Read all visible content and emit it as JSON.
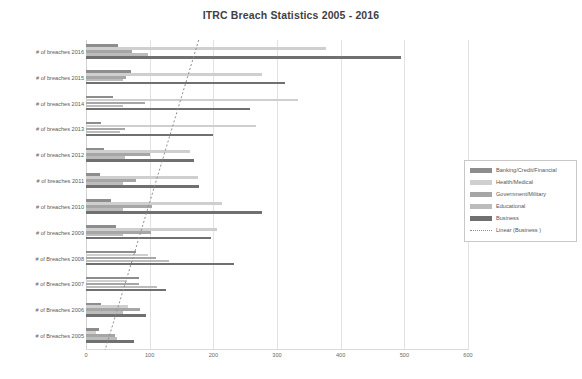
{
  "chart_data": {
    "type": "bar",
    "orientation": "horizontal",
    "title": "ITRC Breach Statistics 2005 - 2016",
    "xlabel": "",
    "ylabel": "",
    "xlim": [
      0,
      600
    ],
    "xticks": [
      0,
      100,
      200,
      300,
      400,
      500,
      600
    ],
    "grid": true,
    "legend_position": "right",
    "categories": [
      "# of breaches 2016",
      "# of breaches 2015",
      "# of breaches 2014",
      "# of breaches 2013",
      "# of breaches 2012",
      "# of breaches 2011",
      "# of breaches 2010",
      "# of breaches 2009",
      "# of Breaches 2008",
      "# of Breaches 2007",
      "# of Breaches 2006",
      "# of Breaches 2005"
    ],
    "series": [
      {
        "name": "Banking/Credit/Financial",
        "color": "#8d8d8d",
        "values": [
          51,
          71,
          43,
          23,
          29,
          22,
          40,
          47,
          78,
          84,
          24,
          20
        ]
      },
      {
        "name": "Health/Medical",
        "color": "#cfcfcf",
        "values": [
          377,
          276,
          333,
          267,
          163,
          176,
          214,
          206,
          97,
          64,
          66,
          16
        ]
      },
      {
        "name": "Government/Military",
        "color": "#a6a6a6",
        "values": [
          72,
          63,
          93,
          61,
          100,
          79,
          104,
          102,
          110,
          83,
          85,
          46
        ]
      },
      {
        "name": "Educational",
        "color": "#bcbcbc",
        "values": [
          98,
          58,
          58,
          54,
          61,
          58,
          58,
          58,
          131,
          112,
          58,
          48
        ]
      },
      {
        "name": "Business",
        "color": "#707070",
        "values": [
          494,
          312,
          258,
          199,
          170,
          178,
          277,
          196,
          233,
          125,
          94,
          75
        ]
      }
    ],
    "trendline": {
      "name": "Linear (Business )",
      "style": "dotted",
      "color": "#8d8d8d",
      "x_at_top": 177,
      "x_at_bottom": 30
    }
  },
  "legend": {
    "items": [
      {
        "label": "Banking/Credit/Financial",
        "swatch": "#8d8d8d",
        "type": "box"
      },
      {
        "label": "Health/Medical",
        "swatch": "#cfcfcf",
        "type": "box"
      },
      {
        "label": "Government/Military",
        "swatch": "#a6a6a6",
        "type": "box"
      },
      {
        "label": "Educational",
        "swatch": "#bcbcbc",
        "type": "box"
      },
      {
        "label": "Business",
        "swatch": "#707070",
        "type": "box"
      },
      {
        "label": "Linear (Business )",
        "swatch": "#8d8d8d",
        "type": "dashed"
      }
    ]
  }
}
